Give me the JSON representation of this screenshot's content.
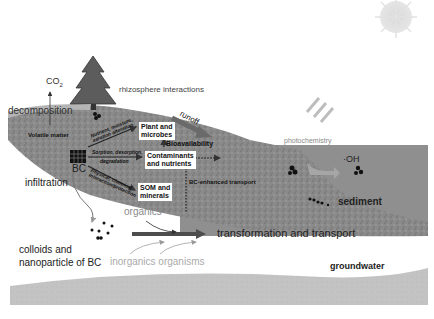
{
  "diagram": {
    "labels": {
      "co2": "CO",
      "co2_sub": "2",
      "rhizosphere": "rhizosphere interactions",
      "decomposition": "decomposition",
      "volatile_matter": "Volatile matter",
      "runoff": "runoff",
      "photochemistry": "photochemistry",
      "oh": "·OH",
      "plant_microbes_1": "Plant and",
      "plant_microbes_2": "microbes",
      "bioavailability": "Bioavailability",
      "contaminants_1": "Contaminants",
      "contaminants_2": "and nutrients",
      "som_1": "SOM and",
      "som_2": "minerals",
      "bc": "BC",
      "bc_transport": "BC-enhanced transport",
      "sorption": "Sorption, desorption,",
      "degradation": "degradation",
      "nutrient_release_1": "Nutrient, moisture,",
      "nutrient_release_2": "aeration alteration",
      "surface_interaction_1": "Physical, chemical",
      "surface_interaction_2": "interaction/protection",
      "infiltration": "infiltration",
      "sediment": "sediment",
      "colloids_1": "colloids and",
      "colloids_2": "nanoparticle of BC",
      "organics": "organics",
      "inorganics_organisms": "inorganics organisms",
      "transformation": "transformation and transport",
      "groundwater": "groundwater"
    },
    "icons": [
      "sun-icon",
      "tree-icon",
      "light-rays-icon",
      "bc-grid-icon",
      "particle-cluster-icon"
    ],
    "colors": {
      "soil": "#8c8c8c",
      "water": "#8e8e8e",
      "groundwater_band": "#c4c4c4",
      "aquifer_white": "#f7f7f7",
      "text_dark": "#222222",
      "text_light": "#9a9a9a",
      "arrow_dark": "#555555"
    }
  }
}
